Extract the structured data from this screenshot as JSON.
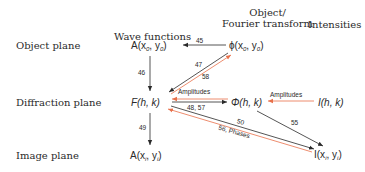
{
  "columns": {
    "wave_functions": "Wave functions",
    "object_ft_line1": "Object/",
    "object_ft_line2": "Fourier transform",
    "intensities": "Intensities"
  },
  "rows": {
    "object_plane": "Object plane",
    "diffraction_plane": "Diffraction plane",
    "image_plane": "Image plane"
  },
  "nodes": {
    "A_obj": {
      "fn": "A",
      "args": "(x",
      "sub1": "0",
      "mid": ", y",
      "sub2": "0",
      "end": ")"
    },
    "phi_obj": {
      "fn": "ϕ",
      "args": "(x",
      "sub1": "0",
      "mid": ", y",
      "sub2": "0",
      "end": ")"
    },
    "F_hk": "F(h, k)",
    "Phi_hk": "Φ(h, k)",
    "I_hk": "I(h, k)",
    "A_img": {
      "fn": "A",
      "args": "(x",
      "sub1": "i",
      "mid": ", y",
      "sub2": "i",
      "end": ")"
    },
    "I_img": {
      "fn": "I",
      "args": "(x",
      "sub1": "i",
      "mid": ", y",
      "sub2": "i",
      "end": ")"
    }
  },
  "edges": {
    "e45": "45",
    "e46": "46",
    "e47": "47",
    "e58": "58",
    "amplitudes_top": "Amplitudes",
    "e48_57": "48, 57",
    "amplitudes_right": "Amplitudes",
    "e49": "49",
    "e50": "50",
    "e56_phases": "56, Phases",
    "e55": "55"
  },
  "colors": {
    "black_arrow": "#2a2a2a",
    "orange_arrow": "#e8704a"
  }
}
